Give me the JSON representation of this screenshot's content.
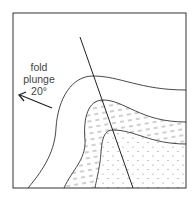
{
  "diagram": {
    "type": "geologic-fold-cross-section",
    "label": {
      "line1": "fold",
      "line2": "plunge",
      "line3": "20°"
    },
    "arrow_direction": "up-left",
    "layers": [
      {
        "name": "outer-layer",
        "pattern": "blank"
      },
      {
        "name": "middle-layer",
        "pattern": "dashes"
      },
      {
        "name": "core-layer",
        "pattern": "dots"
      }
    ],
    "elements": {
      "axial_plane_trace": "line",
      "frame": "square-border"
    },
    "colors": {
      "line": "#333333",
      "pattern": "#888888",
      "background": "#ffffff"
    }
  }
}
